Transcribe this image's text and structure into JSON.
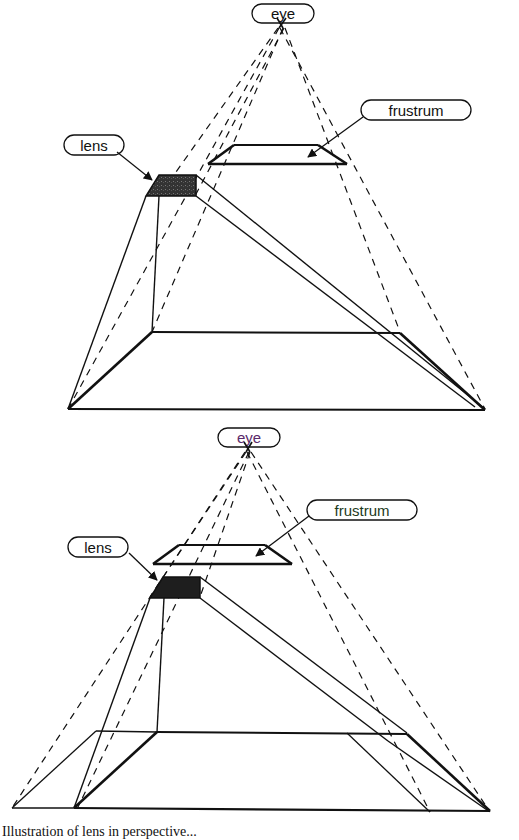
{
  "figure": {
    "panels": [
      {
        "id": "top",
        "labels": {
          "eye": "eye",
          "frustrum": "frustrum",
          "lens": "lens"
        },
        "variant": "lens projection onto base plane"
      },
      {
        "id": "bottom",
        "labels": {
          "eye": "eye",
          "frustrum": "frustrum",
          "lens": "lens"
        },
        "variant": "lens projection with extended base plane"
      }
    ],
    "caption": "Illustration of lens in perspective..."
  },
  "colors": {
    "line": "#111111",
    "lens_fill": "#2a2a2a",
    "background": "#ffffff"
  }
}
